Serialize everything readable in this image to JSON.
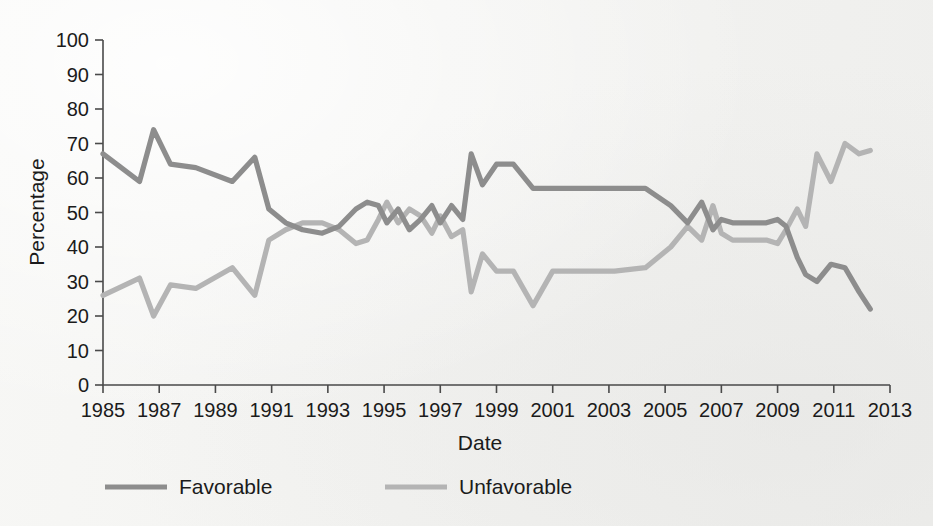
{
  "chart_data": {
    "type": "line",
    "title": "",
    "subtitle": "",
    "xlabel": "Date",
    "ylabel": "Percentage",
    "xlim": [
      1985,
      2013
    ],
    "ylim": [
      0,
      100
    ],
    "grid": false,
    "legend_position": "bottom-left",
    "x_tick_labels": [
      "1985",
      "1987",
      "1989",
      "1991",
      "1993",
      "1995",
      "1997",
      "1999",
      "2001",
      "2003",
      "2005",
      "2007",
      "2009",
      "2011",
      "2013"
    ],
    "x_ticks": [
      1985,
      1987,
      1989,
      1991,
      1993,
      1995,
      1997,
      1999,
      2001,
      2003,
      2005,
      2007,
      2009,
      2011,
      2013
    ],
    "y_tick_labels": [
      "0",
      "10",
      "20",
      "30",
      "40",
      "50",
      "60",
      "70",
      "80",
      "90",
      "100"
    ],
    "y_ticks": [
      0,
      10,
      20,
      30,
      40,
      50,
      60,
      70,
      80,
      90,
      100
    ],
    "colors": {
      "favorable": "#8d8d8d",
      "unfavorable": "#b4b4b4",
      "axis": "#4a4a4a",
      "text": "#1b1b1b",
      "background": "#f5f4f2"
    },
    "series": [
      {
        "name": "Favorable",
        "color": "#8d8d8d",
        "x": [
          1985.0,
          1986.3,
          1986.8,
          1987.4,
          1988.3,
          1989.6,
          1990.4,
          1990.9,
          1991.5,
          1992.1,
          1992.8,
          1993.4,
          1994.0,
          1994.4,
          1994.8,
          1995.1,
          1995.5,
          1995.9,
          1996.3,
          1996.7,
          1997.0,
          1997.4,
          1997.8,
          1998.1,
          1998.5,
          1999.0,
          1999.6,
          2000.3,
          2001.0,
          2002.0,
          2003.2,
          2004.3,
          2005.2,
          2005.8,
          2006.3,
          2006.7,
          2007.0,
          2007.4,
          2008.0,
          2008.6,
          2009.0,
          2009.3,
          2009.7,
          2010.0,
          2010.4,
          2010.9,
          2011.4,
          2011.9,
          2012.3
        ],
        "y": [
          67,
          59,
          74,
          64,
          63,
          59,
          66,
          51,
          47,
          45,
          44,
          46,
          51,
          53,
          52,
          47,
          51,
          45,
          48,
          52,
          47,
          52,
          48,
          67,
          58,
          64,
          64,
          57,
          57,
          57,
          57,
          57,
          52,
          47,
          53,
          45,
          48,
          47,
          47,
          47,
          48,
          46,
          37,
          32,
          30,
          35,
          34,
          27,
          22
        ]
      },
      {
        "name": "Unfavorable",
        "color": "#b4b4b4",
        "x": [
          1985.0,
          1986.3,
          1986.8,
          1987.4,
          1988.3,
          1989.6,
          1990.4,
          1990.9,
          1991.5,
          1992.1,
          1992.8,
          1993.4,
          1994.0,
          1994.4,
          1994.8,
          1995.1,
          1995.5,
          1995.9,
          1996.3,
          1996.7,
          1997.0,
          1997.4,
          1997.8,
          1998.1,
          1998.5,
          1999.0,
          1999.6,
          2000.3,
          2001.0,
          2002.0,
          2003.2,
          2004.3,
          2005.2,
          2005.8,
          2006.3,
          2006.7,
          2007.0,
          2007.4,
          2008.0,
          2008.6,
          2009.0,
          2009.3,
          2009.7,
          2010.0,
          2010.4,
          2010.9,
          2011.4,
          2011.9,
          2012.3
        ],
        "y": [
          26,
          31,
          20,
          29,
          28,
          34,
          26,
          42,
          45,
          47,
          47,
          45,
          41,
          42,
          48,
          53,
          47,
          51,
          49,
          44,
          49,
          43,
          45,
          27,
          38,
          33,
          33,
          23,
          33,
          33,
          33,
          34,
          40,
          46,
          42,
          52,
          44,
          42,
          42,
          42,
          41,
          45,
          51,
          46,
          67,
          59,
          70,
          67,
          68
        ]
      }
    ]
  },
  "legend": {
    "items": [
      {
        "label": "Favorable",
        "color": "#8d8d8d"
      },
      {
        "label": "Unfavorable",
        "color": "#b4b4b4"
      }
    ]
  }
}
